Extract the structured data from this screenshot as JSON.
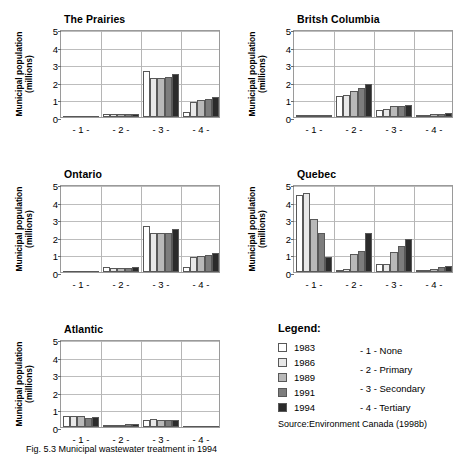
{
  "figure": {
    "source_note": "Source:Environment Canada (1998b)",
    "caption": "Fig. 5.3  Municipal wastewater treatment in 1994"
  },
  "legend": {
    "title": "Legend:",
    "series": [
      {
        "label": "1983",
        "color": "#ffffff"
      },
      {
        "label": "1986",
        "color": "#e8e8e8"
      },
      {
        "label": "1989",
        "color": "#b9b9b9"
      },
      {
        "label": "1991",
        "color": "#7d7d7d"
      },
      {
        "label": "1994",
        "color": "#2b2b2b"
      }
    ],
    "categories": [
      "- 1 - None",
      "- 2 - Primary",
      "- 3 - Secondary",
      "- 4 - Tertiary"
    ]
  },
  "chart_data": [
    {
      "type": "bar",
      "title": "The Prairies",
      "xlabel": "",
      "ylabel": "Municipal population (millions)",
      "ylim": [
        0,
        5
      ],
      "yticks": [
        0,
        1,
        2,
        3,
        4,
        5
      ],
      "categories": [
        "- 1 -",
        "- 2 -",
        "- 3 -",
        "- 4 -"
      ],
      "grid": true,
      "series": [
        {
          "name": "1983",
          "values": [
            0.0,
            0.15,
            2.6,
            0.3
          ]
        },
        {
          "name": "1986",
          "values": [
            0.0,
            0.15,
            2.2,
            0.85
          ]
        },
        {
          "name": "1989",
          "values": [
            0.0,
            0.15,
            2.2,
            0.95
          ]
        },
        {
          "name": "1991",
          "values": [
            0.0,
            0.15,
            2.3,
            1.0
          ]
        },
        {
          "name": "1994",
          "values": [
            0.0,
            0.15,
            2.45,
            1.15
          ]
        }
      ]
    },
    {
      "type": "bar",
      "title": "Britsh Columbia",
      "xlabel": "",
      "ylabel": "Municipal population (millions)",
      "ylim": [
        0,
        5
      ],
      "yticks": [
        0,
        1,
        2,
        3,
        4,
        5
      ],
      "categories": [
        "- 1 -",
        "- 2 -",
        "- 3 -",
        "- 4 -"
      ],
      "grid": true,
      "series": [
        {
          "name": "1983",
          "values": [
            0.1,
            1.2,
            0.4,
            0.1
          ]
        },
        {
          "name": "1986",
          "values": [
            0.12,
            1.25,
            0.45,
            0.1
          ]
        },
        {
          "name": "1989",
          "values": [
            0.07,
            1.5,
            0.6,
            0.15
          ]
        },
        {
          "name": "1991",
          "values": [
            0.07,
            1.65,
            0.62,
            0.18
          ]
        },
        {
          "name": "1994",
          "values": [
            0.08,
            1.85,
            0.7,
            0.22
          ]
        }
      ]
    },
    {
      "type": "bar",
      "title": "Ontario",
      "xlabel": "",
      "ylabel": "Municipal population (millions)",
      "ylim": [
        0,
        5
      ],
      "yticks": [
        0,
        1,
        2,
        3,
        4,
        5
      ],
      "categories": [
        "- 1 -",
        "- 2 -",
        "- 3 -",
        "- 4 -"
      ],
      "grid": true,
      "series": [
        {
          "name": "1983",
          "values": [
            0.0,
            0.3,
            2.6,
            0.3
          ]
        },
        {
          "name": "1986",
          "values": [
            0.0,
            0.2,
            2.2,
            0.85
          ]
        },
        {
          "name": "1989",
          "values": [
            0.0,
            0.2,
            2.2,
            0.9
          ]
        },
        {
          "name": "1991",
          "values": [
            0.0,
            0.25,
            2.2,
            0.95
          ]
        },
        {
          "name": "1994",
          "values": [
            0.0,
            0.28,
            2.45,
            1.1
          ]
        }
      ]
    },
    {
      "type": "bar",
      "title": "Quebec",
      "xlabel": "",
      "ylabel": "Municipal population (millions)",
      "ylim": [
        0,
        5
      ],
      "yticks": [
        0,
        1,
        2,
        3,
        4,
        5
      ],
      "categories": [
        "- 1 -",
        "- 2 -",
        "- 3 -",
        "- 4 -"
      ],
      "grid": true,
      "series": [
        {
          "name": "1983",
          "values": [
            4.4,
            0.1,
            0.45,
            0.05
          ]
        },
        {
          "name": "1986",
          "values": [
            4.5,
            0.15,
            0.45,
            0.05
          ]
        },
        {
          "name": "1989",
          "values": [
            3.0,
            1.0,
            1.15,
            0.15
          ]
        },
        {
          "name": "1991",
          "values": [
            2.2,
            1.2,
            1.45,
            0.3
          ]
        },
        {
          "name": "1994",
          "values": [
            0.85,
            2.2,
            1.85,
            0.35
          ]
        }
      ]
    },
    {
      "type": "bar",
      "title": "Atlantic",
      "xlabel": "",
      "ylabel": "Municipal population (millions)",
      "ylim": [
        0,
        5
      ],
      "yticks": [
        0,
        1,
        2,
        3,
        4,
        5
      ],
      "categories": [
        "- 1 -",
        "- 2 -",
        "- 3 -",
        "- 4 -"
      ],
      "grid": true,
      "series": [
        {
          "name": "1983",
          "values": [
            0.6,
            0.05,
            0.4,
            0.0
          ]
        },
        {
          "name": "1986",
          "values": [
            0.62,
            0.08,
            0.45,
            0.0
          ]
        },
        {
          "name": "1989",
          "values": [
            0.6,
            0.12,
            0.42,
            0.0
          ]
        },
        {
          "name": "1991",
          "values": [
            0.52,
            0.15,
            0.42,
            0.0
          ]
        },
        {
          "name": "1994",
          "values": [
            0.58,
            0.15,
            0.42,
            0.0
          ]
        }
      ]
    }
  ]
}
